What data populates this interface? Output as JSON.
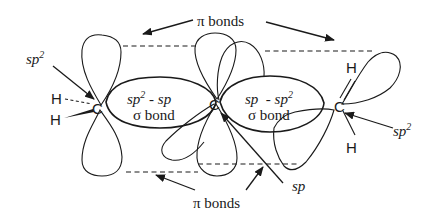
{
  "figure": {
    "atoms": {
      "c_left": "C",
      "c_center": "C",
      "c_right": "C",
      "h_left_top": "H",
      "h_left_bottom": "H",
      "h_right_top": "H",
      "h_right_bottom": "H"
    },
    "labels": {
      "pi_bonds_top": "π bonds",
      "pi_bonds_bottom": "π bonds",
      "sigma_left_line1_base": "sp",
      "sigma_left_line1_sup": "2",
      "sigma_left_line1_rest": " - sp",
      "sigma_left_line2": "σ bond",
      "sigma_right_line1_base": "sp  - sp",
      "sigma_right_line1_sup": "2",
      "sigma_right_line2": "σ bond",
      "left_hybrid_base": "sp",
      "left_hybrid_sup": "2",
      "right_hybrid_base": "sp",
      "right_hybrid_sup": "2",
      "center_hybrid": "sp"
    },
    "colors": {
      "ink": "#1a1a1a",
      "background": "#ffffff"
    }
  }
}
